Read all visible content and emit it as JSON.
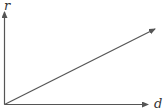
{
  "diagram": {
    "type": "axes-with-ray",
    "y_axis_label": "r",
    "x_axis_label": "d",
    "line_color": "#555555",
    "ray": {
      "from": "origin",
      "direction": "up-right"
    }
  }
}
